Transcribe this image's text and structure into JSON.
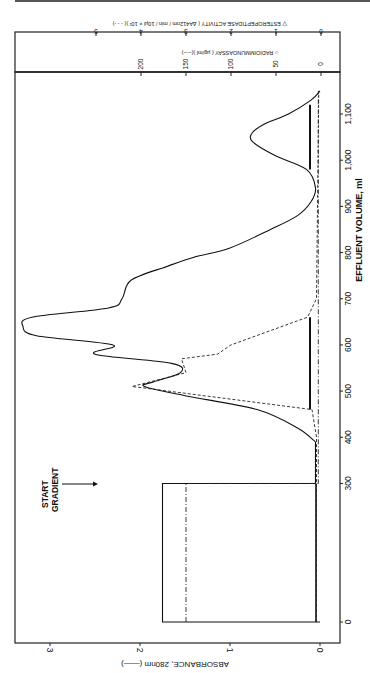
{
  "chart_data": {
    "type": "line",
    "orientation": "rotated 90 degrees (x-axis vertical along right edge, y-axes along bottom/top)",
    "xlabel": "EFFLUENT VOLUME, ml",
    "x_ticks": [
      0,
      300,
      400,
      500,
      600,
      700,
      800,
      900,
      1000,
      1100
    ],
    "x_tick_labels": [
      "0",
      "300",
      "400",
      "500",
      "600",
      "700",
      "800",
      "900",
      "1,000",
      "1,100"
    ],
    "xlim": [
      -10,
      1160
    ],
    "y_axes": [
      {
        "label": "ABSORBANCE, 280nm (——)",
        "ticks": [
          0,
          1,
          2,
          3
        ],
        "ylim": [
          -0.2,
          3.4
        ]
      },
      {
        "label": "○ RADIOIMMUNOASSAY (µg/ml)(–·–)",
        "ticks": [
          0,
          50,
          100,
          150,
          200
        ]
      },
      {
        "label": "▽ ESTEROPEPTIDASE ACTIVITY (ΔA412nm / min / 10µl × 10²)(- - -)",
        "ticks": [
          0,
          1,
          2,
          3,
          4,
          5
        ]
      }
    ],
    "annotations": [
      {
        "text": "START GRADIENT",
        "x": 300,
        "arrow": true
      }
    ],
    "series": [
      {
        "name": "Absorbance 280nm",
        "style": "solid",
        "x": [
          0,
          0,
          300,
          300,
          390,
          420,
          460,
          490,
          510,
          520,
          540,
          560,
          580,
          600,
          620,
          640,
          660,
          680,
          700,
          740,
          770,
          790,
          810,
          850,
          880,
          910,
          940,
          980,
          1010,
          1040,
          1060,
          1080,
          1100,
          1130,
          1150
        ],
        "values": [
          0,
          1.75,
          1.75,
          0.05,
          0.05,
          0.25,
          0.7,
          1.5,
          1.95,
          1.85,
          1.55,
          1.65,
          2.5,
          2.3,
          3.15,
          3.3,
          3.2,
          2.35,
          2.2,
          2.1,
          1.7,
          1.4,
          1.0,
          0.55,
          0.25,
          0.1,
          0.05,
          0.15,
          0.5,
          0.75,
          0.75,
          0.6,
          0.35,
          0.1,
          0.0
        ]
      },
      {
        "name": "Radioimmunoassay (µg/ml)",
        "style": "dash-dot",
        "x": [
          0,
          300,
          300,
          1150
        ],
        "values": [
          150,
          150,
          3,
          3
        ],
        "bars": [
          {
            "x_start": 460,
            "x_end": 660,
            "value": 10
          },
          {
            "x_start": 980,
            "x_end": 1120,
            "value": 10
          }
        ]
      },
      {
        "name": "Esteropeptidase activity",
        "style": "dashed",
        "x": [
          0,
          300,
          400,
          460,
          510,
          540,
          570,
          580,
          600,
          660,
          700,
          1150
        ],
        "values": [
          0.1,
          0.1,
          0.1,
          0.2,
          4.2,
          3.0,
          3.1,
          2.3,
          2.0,
          0.3,
          0.1,
          0.05
        ]
      }
    ]
  },
  "labels": {
    "x_axis_title": "EFFLUENT VOLUME, ml",
    "absorbance_title": "ABSORBANCE, 280nm (——)",
    "ria_title": "○ RADIOIMMUNOASSAY ( µg/ml )(–·–)",
    "ester_title": "▽ ESTEROPEPTIDASE ACTIVITY ( ΔA412nm / min / 10µl × 10² )( - - -)",
    "start_gradient_line1": "START",
    "start_gradient_line2": "GRADIENT"
  }
}
